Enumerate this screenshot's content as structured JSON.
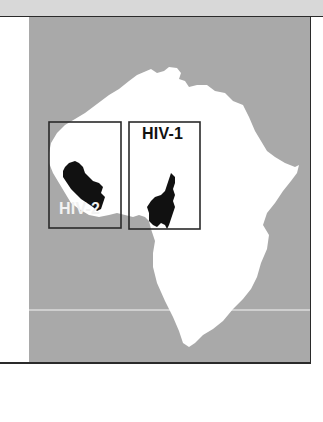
{
  "figure": {
    "type": "map",
    "region": "Africa",
    "colors": {
      "ocean": "#a9a9a9",
      "land": "#ffffff",
      "highlight_countries": "#111111",
      "frame": "#2a2a2a",
      "top_strip": "#d8d8d8",
      "latitude_line": "#cfcfcf"
    },
    "regions": [
      {
        "label": "HIV-2",
        "location": "West Africa",
        "label_color": "#f2f2f2",
        "label_position": "bottom of box"
      },
      {
        "label": "HIV-1",
        "location": "West-Central Africa",
        "label_color": "#111111",
        "label_position": "top of box"
      }
    ],
    "lines": [
      {
        "name": "latitude-line",
        "orientation": "horizontal"
      }
    ]
  }
}
